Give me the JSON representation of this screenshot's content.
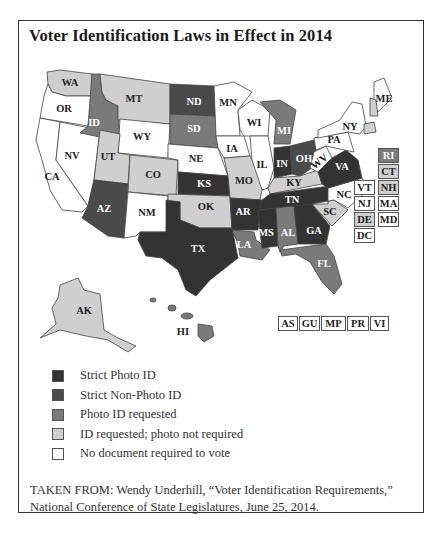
{
  "title": "Voter Identification Laws in Effect in 2014",
  "colors": {
    "strict_photo": "#333333",
    "strict_non_photo": "#4a4a4a",
    "photo_requested": "#7a7a7a",
    "id_requested": "#cfcfcf",
    "none": "#ffffff",
    "border": "#444444"
  },
  "legend": [
    {
      "key": "strict_photo",
      "label": "Strict Photo ID",
      "color": "#333333"
    },
    {
      "key": "strict_non_photo",
      "label": "Strict Non-Photo ID",
      "color": "#4a4a4a"
    },
    {
      "key": "photo_requested",
      "label": "Photo ID requested",
      "color": "#7a7a7a"
    },
    {
      "key": "id_requested",
      "label": "ID requested; photo not required",
      "color": "#cfcfcf"
    },
    {
      "key": "none",
      "label": "No document required to vote",
      "color": "#ffffff"
    }
  ],
  "states": {
    "WA": "id_requested",
    "OR": "none",
    "CA": "none",
    "NV": "none",
    "ID": "photo_requested",
    "MT": "id_requested",
    "WY": "none",
    "UT": "id_requested",
    "CO": "id_requested",
    "AZ": "strict_non_photo",
    "NM": "none",
    "ND": "strict_non_photo",
    "SD": "photo_requested",
    "NE": "none",
    "KS": "strict_photo",
    "OK": "id_requested",
    "TX": "strict_photo",
    "MN": "none",
    "IA": "none",
    "MO": "id_requested",
    "AR": "strict_photo",
    "LA": "photo_requested",
    "WI": "none",
    "IL": "none",
    "MI": "photo_requested",
    "IN": "strict_photo",
    "OH": "strict_non_photo",
    "KY": "id_requested",
    "TN": "strict_photo",
    "MS": "strict_photo",
    "AL": "photo_requested",
    "GA": "strict_photo",
    "FL": "photo_requested",
    "SC": "id_requested",
    "NC": "none",
    "VA": "strict_photo",
    "WV": "none",
    "PA": "none",
    "NY": "none",
    "ME": "none",
    "AK": "id_requested",
    "HI": "photo_requested"
  },
  "side_boxes": [
    {
      "code": "RI",
      "category": "photo_requested"
    },
    {
      "code": "CT",
      "category": "id_requested"
    },
    {
      "code": "VT",
      "category": "none"
    },
    {
      "code": "NH",
      "category": "id_requested"
    },
    {
      "code": "NJ",
      "category": "none"
    },
    {
      "code": "MA",
      "category": "none"
    },
    {
      "code": "DE",
      "category": "id_requested"
    },
    {
      "code": "MD",
      "category": "none"
    },
    {
      "code": "DC",
      "category": "none"
    }
  ],
  "territories": [
    {
      "code": "AS",
      "category": "none"
    },
    {
      "code": "GU",
      "category": "none"
    },
    {
      "code": "MP",
      "category": "none"
    },
    {
      "code": "PR",
      "category": "none"
    },
    {
      "code": "VI",
      "category": "none"
    }
  ],
  "source": {
    "line1": "TAKEN FROM: Wendy Underhill, “Voter Identification Requirements,”",
    "line2": "National Conference of State Legislatures, June 25, 2014."
  }
}
